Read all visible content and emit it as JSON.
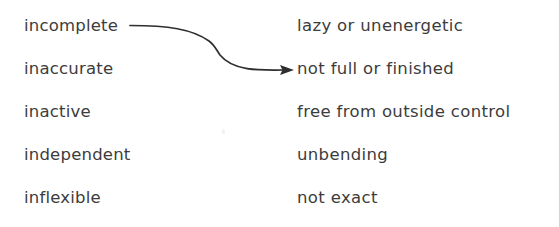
{
  "document": {
    "kind": "vocabulary-matching-worksheet",
    "background_color": "#ffffff",
    "text_color": "#3c3c3c",
    "connector_color": "#2e2e2e"
  },
  "left_column": {
    "name": "terms",
    "items": [
      {
        "label": "incomplete"
      },
      {
        "label": "inaccurate"
      },
      {
        "label": "inactive"
      },
      {
        "label": "independent"
      },
      {
        "label": "inflexible"
      }
    ]
  },
  "right_column": {
    "name": "definitions",
    "items": [
      {
        "label": "lazy or unenergetic"
      },
      {
        "label": "not full or finished"
      },
      {
        "label": "free from outside control"
      },
      {
        "label": "unbending"
      },
      {
        "label": "not exact"
      }
    ]
  },
  "connections": [
    {
      "name": "incomplete-to-not-full-or-finished",
      "from": "incomplete",
      "to": "not full or finished",
      "style": "curved-arrow"
    }
  ]
}
